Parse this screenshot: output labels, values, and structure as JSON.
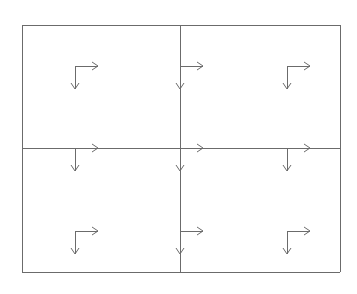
{
  "diagram": {
    "type": "2x2 grid with axis glyphs",
    "stroke_color": "#6b6b6b",
    "background": "#ffffff",
    "frame": {
      "left": 22,
      "top": 25,
      "right": 340,
      "bottom": 272
    },
    "dividers": {
      "vertical_x": 180,
      "horizontal_y": 148
    },
    "cells": [
      {
        "id": "top-left"
      },
      {
        "id": "top-right"
      },
      {
        "id": "bottom-left"
      },
      {
        "id": "bottom-right"
      }
    ],
    "axis_glyphs": [
      {
        "id": "axis-top-left",
        "x": 75,
        "y": 66,
        "len_x": 23,
        "len_y": 23
      },
      {
        "id": "axis-top-right",
        "x": 287,
        "y": 66,
        "len_x": 23,
        "len_y": 23
      },
      {
        "id": "axis-mid-left",
        "x": 75,
        "y": 148,
        "len_x": 23,
        "len_y": 23
      },
      {
        "id": "axis-mid-right",
        "x": 287,
        "y": 148,
        "len_x": 23,
        "len_y": 23
      },
      {
        "id": "axis-bottom-left",
        "x": 75,
        "y": 231,
        "len_x": 23,
        "len_y": 23
      },
      {
        "id": "axis-bottom-right",
        "x": 287,
        "y": 231,
        "len_x": 23,
        "len_y": 23
      },
      {
        "id": "axis-center-top",
        "x": 180,
        "y": 66,
        "len_x": 23,
        "len_y": 23
      },
      {
        "id": "axis-center-mid",
        "x": 180,
        "y": 148,
        "len_x": 23,
        "len_y": 23
      },
      {
        "id": "axis-center-bottom",
        "x": 180,
        "y": 231,
        "len_x": 23,
        "len_y": 23
      }
    ]
  }
}
